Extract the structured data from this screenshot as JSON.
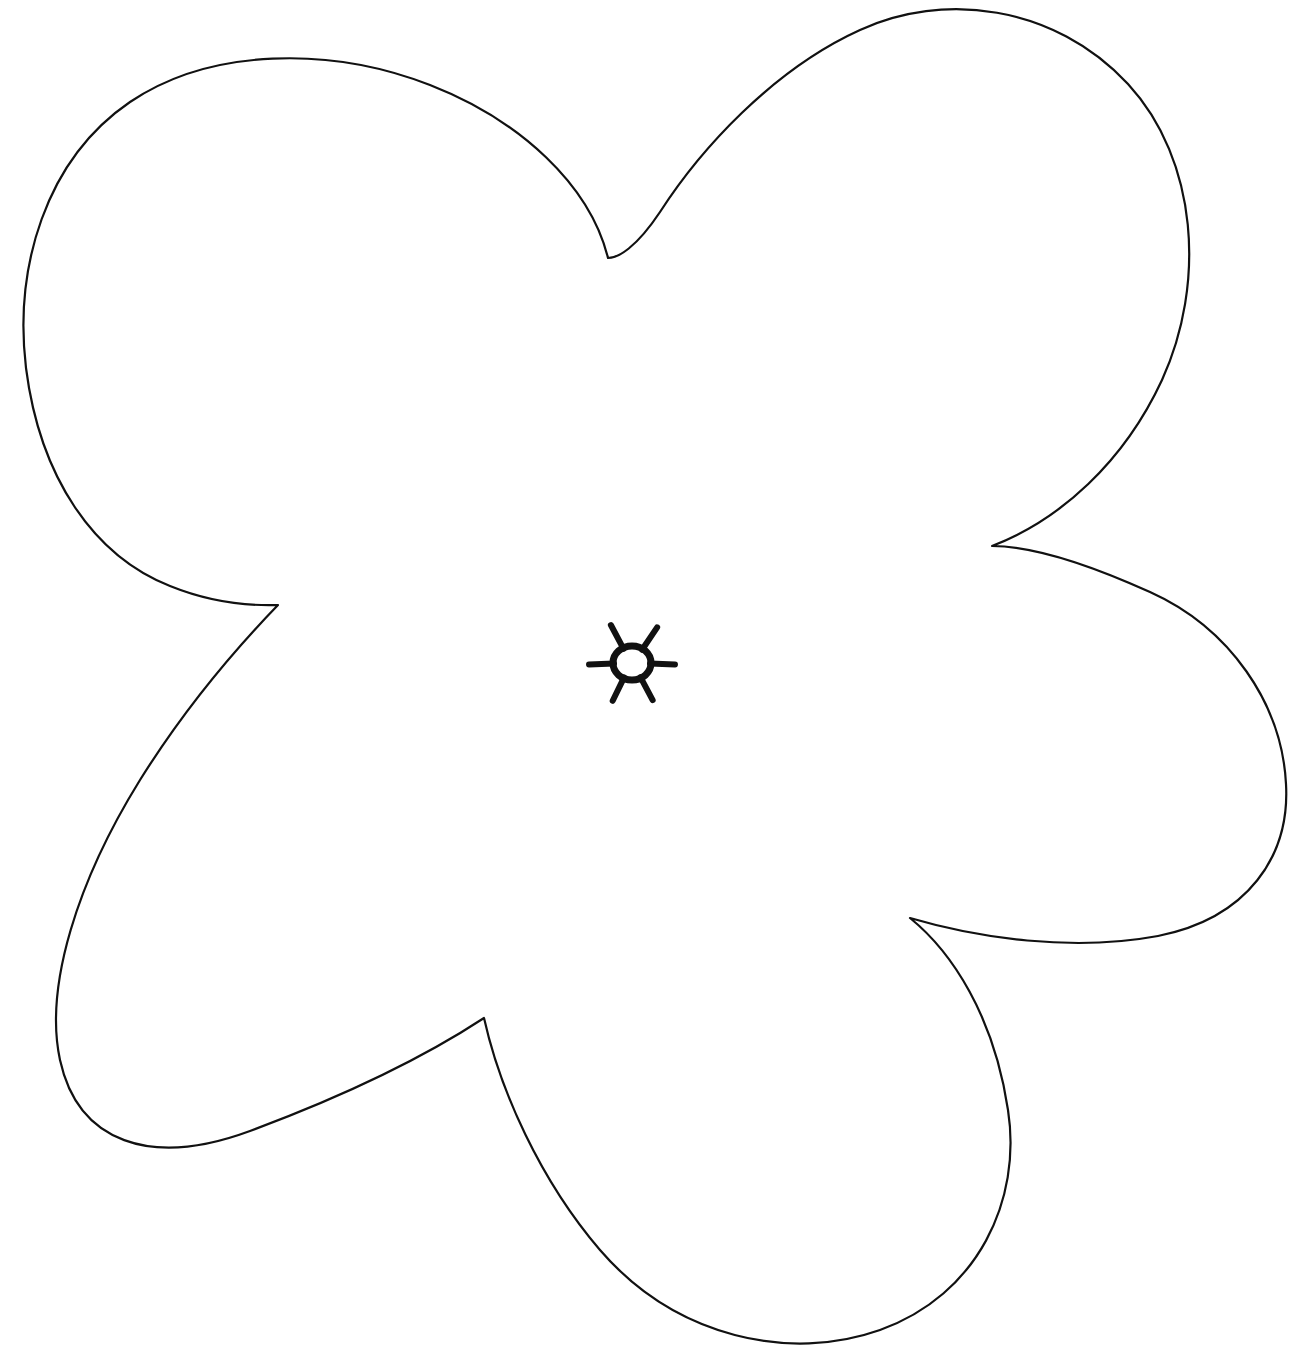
{
  "document": {
    "title": "Five-Petal Flower Outline",
    "kind": "line-art-coloring-page",
    "canvas": {
      "width": 1291,
      "height": 1372
    },
    "background_color": "#ffffff",
    "stroke_color": "#111111",
    "stroke_width": 2.2,
    "fill_color": "#ffffff",
    "visible_text": ""
  },
  "flower": {
    "name": "five-petal-flower",
    "petal_count": 5,
    "center": {
      "x": 632,
      "y": 663
    },
    "petal_tips": [
      {
        "name": "petal-tip-top-left",
        "x": 290,
        "y": 68
      },
      {
        "name": "petal-tip-top-right",
        "x": 930,
        "y": 10
      },
      {
        "name": "petal-tip-right",
        "x": 1285,
        "y": 790
      },
      {
        "name": "petal-tip-bottom",
        "x": 750,
        "y": 1334
      },
      {
        "name": "petal-tip-bottom-left",
        "x": 240,
        "y": 1132
      }
    ],
    "notch_cusps": [
      {
        "name": "cusp-top",
        "x": 608,
        "y": 258
      },
      {
        "name": "cusp-right",
        "x": 992,
        "y": 546
      },
      {
        "name": "cusp-bottom-right",
        "x": 910,
        "y": 918
      },
      {
        "name": "cusp-bottom-left",
        "x": 484,
        "y": 1018
      },
      {
        "name": "cusp-left",
        "x": 278,
        "y": 605
      }
    ],
    "outline_path": "M 608 258 C 590 185 520 120 430 85 C 330 46 210 48 130 102 C 45 160 14 268 26 368 C 40 478 94 556 170 586 C 212 603 248 606 278 605 C 248 636 190 700 140 780 C 78 880 44 986 60 1060 C 78 1142 150 1168 250 1131 C 344 1096 420 1060 484 1018 C 500 1090 540 1180 600 1250 C 676 1338 790 1362 880 1330 C 978 1295 1022 1200 1008 1110 C 994 1016 952 952 910 918 C 978 938 1072 952 1158 936 C 1248 918 1290 856 1286 784 C 1282 704 1230 628 1150 592 C 1066 554 1018 546 992 546 C 1060 520 1124 462 1162 380 C 1206 284 1198 160 1128 84 C 1054 4 942 -8 860 30 C 772 70 700 150 660 212 C 636 248 618 258 608 258 Z",
    "sun": {
      "name": "center-sunburst",
      "center": {
        "x": 632,
        "y": 663
      },
      "ring_rx": 19,
      "ring_ry": 17,
      "spike_count": 6,
      "spikes": [
        {
          "name": "spike-up-left",
          "angle_deg": -118,
          "length": 26
        },
        {
          "name": "spike-up-right",
          "angle_deg": -56,
          "length": 26
        },
        {
          "name": "spike-right",
          "angle_deg": 2,
          "length": 24
        },
        {
          "name": "spike-down-right",
          "angle_deg": 62,
          "length": 25
        },
        {
          "name": "spike-down-left",
          "angle_deg": 116,
          "length": 25
        },
        {
          "name": "spike-left",
          "angle_deg": 178,
          "length": 24
        }
      ],
      "ring_stroke_width": 7
    }
  }
}
